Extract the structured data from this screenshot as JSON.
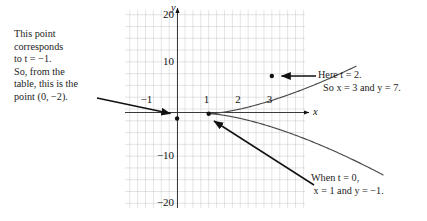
{
  "figure": {
    "title_text": "",
    "annotations": {
      "left_note": "This point\ncorresponds\nto t = −1.\nSo, from the\ntable, this is the\npoint (0, −2).",
      "right_note_top": "Here t = 2.\n  So x = 3 and y = 7.",
      "right_note_bottom": "When t = 0,\n x = 1 and y = −1."
    },
    "axis_labels": {
      "x": "x",
      "y": "y"
    }
  },
  "chart_data": {
    "type": "line",
    "title": "",
    "xlabel": "x",
    "ylabel": "y",
    "xlim": [
      -1.65,
      4.05
    ],
    "ylim": [
      -21.0,
      21.0
    ],
    "grid": true,
    "grid_step_x": 0.25,
    "grid_step_y": 2.5,
    "legend": "none",
    "xticks": [
      -1,
      1,
      2,
      3
    ],
    "xtick_labels": [
      "−1",
      "1",
      "2",
      "3"
    ],
    "yticks": [
      20,
      10,
      -10,
      -20
    ],
    "ytick_labels": [
      "20",
      "10",
      "−10",
      "−20"
    ],
    "series": [
      {
        "name": "parametric curve x = t^2+1, y = t^3-1",
        "parametric": true,
        "t_range": [
          -2.35,
          2.16
        ],
        "x_expr": "t*t + 1",
        "y_expr": "t*t*t - 1",
        "points": [
          {
            "t": -1,
            "x": 0,
            "y": -2,
            "label": "point (0, −2)",
            "marked": true
          },
          {
            "t": 0,
            "x": 1,
            "y": -1,
            "label": "When t = 0, x = 1 and y = −1.",
            "marked": true
          },
          {
            "t": 2,
            "x": 3,
            "y": 7,
            "label": "Here t = 2. So x = 3 and y = 7.",
            "marked": true
          }
        ]
      }
    ],
    "annotations": [
      {
        "name": "arrow-to-point-t-minus-1",
        "from": [
          -1.62,
          1.1
        ],
        "to": [
          0.02,
          -1.95
        ]
      },
      {
        "name": "arrow-to-point-t-2",
        "from": [
          4.02,
          7.0
        ],
        "to": [
          3.1,
          7.0
        ]
      },
      {
        "name": "arrow-to-point-t-0",
        "from": [
          4.0,
          -15.4
        ],
        "to": [
          1.05,
          -1.3
        ]
      }
    ]
  }
}
